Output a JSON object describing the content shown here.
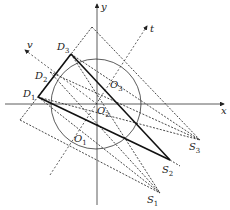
{
  "diagram": {
    "axes": {
      "x_label": "x",
      "y_label": "y"
    },
    "direction_labels": {
      "v": "v",
      "t": "t"
    },
    "points": {
      "D1": {
        "base": "D",
        "sub": "1"
      },
      "D2": {
        "base": "D",
        "sub": "2"
      },
      "D3": {
        "base": "D",
        "sub": "3"
      },
      "O1": {
        "base": "O",
        "sub": "1"
      },
      "O2": {
        "base": "O",
        "sub": "2"
      },
      "O3": {
        "base": "O",
        "sub": "3"
      },
      "S1": {
        "base": "S",
        "sub": "1"
      },
      "S2": {
        "base": "S",
        "sub": "2"
      },
      "S3": {
        "base": "S",
        "sub": "3"
      }
    },
    "colors": {
      "line": "#222222",
      "background": "#ffffff"
    }
  }
}
